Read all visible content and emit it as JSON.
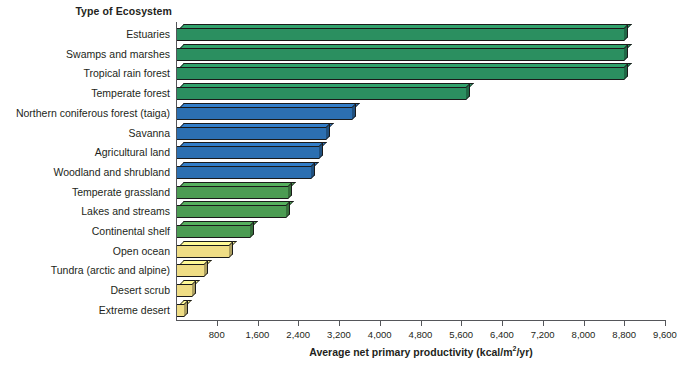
{
  "chart_data": {
    "type": "bar",
    "orientation": "horizontal",
    "title": "",
    "ylabel": "Type of Ecosystem",
    "xlabel": "Average net primary productivity (kcal/m2/yr)",
    "xlabel_prefix": "Average net primary productivity (kcal/m",
    "xlabel_sup": "2",
    "xlabel_suffix": "/yr)",
    "xlim": [
      0,
      9600
    ],
    "xtick_step": 800,
    "xtick_labels": [
      "800",
      "1,600",
      "2,400",
      "3,200",
      "4,000",
      "4,800",
      "5,600",
      "6,400",
      "7,200",
      "8,000",
      "8,800",
      "9,600"
    ],
    "xtick_values": [
      800,
      1600,
      2400,
      3200,
      4000,
      4800,
      5600,
      6400,
      7200,
      8000,
      8800,
      9600
    ],
    "grid": false,
    "legend": "none",
    "categories": [
      "Estuaries",
      "Swamps and marshes",
      "Tropical rain forest",
      "Temperate forest",
      "Northern coniferous forest (taiga)",
      "Savanna",
      "Agricultural land",
      "Woodland and shrubland",
      "Temperate grassland",
      "Lakes and streams",
      "Continental shelf",
      "Open ocean",
      "Tundra (arctic and alpine)",
      "Desert scrub",
      "Extreme desert"
    ],
    "values": [
      8800,
      8800,
      8800,
      5700,
      3450,
      2950,
      2800,
      2650,
      2200,
      2150,
      1450,
      1050,
      550,
      310,
      160
    ],
    "bar_colors": [
      "#2b8f60",
      "#2b8f60",
      "#2b8f60",
      "#2b8f60",
      "#2c6fb1",
      "#2c6fb1",
      "#2c6fb1",
      "#2c6fb1",
      "#4c9c53",
      "#4c9c53",
      "#4c9c53",
      "#efdd85",
      "#efdd85",
      "#efdd85",
      "#efdd85"
    ],
    "palette": {
      "teal_green": "#2b8f60",
      "blue": "#2c6fb1",
      "green": "#4c9c53",
      "yellow": "#efdd85",
      "outline": "#1a1a1a",
      "axis": "#55565a",
      "text": "#231f20"
    }
  }
}
